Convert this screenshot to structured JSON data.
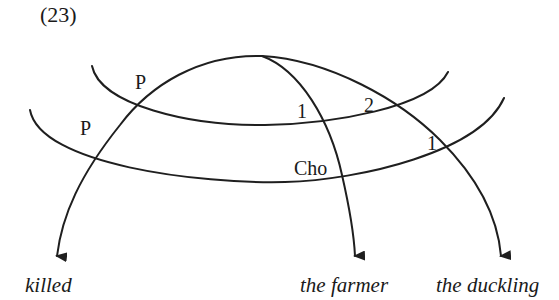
{
  "example": {
    "number": "(23)"
  },
  "diagram": {
    "type": "cluster-arrow diagram",
    "bands": [
      {
        "id": "upper-band",
        "labels": [
          "P",
          "1",
          "2"
        ]
      },
      {
        "id": "lower-band",
        "labels": [
          "P",
          "Cho",
          "1"
        ]
      }
    ],
    "labels": {
      "upper_p": "P",
      "lower_p": "P",
      "upper_1": "1",
      "upper_2": "2",
      "lower_cho": "Cho",
      "lower_1": "1"
    },
    "targets": [
      {
        "id": "killed",
        "text": "killed"
      },
      {
        "id": "the-farmer",
        "text": "the farmer"
      },
      {
        "id": "the-duckling",
        "text": "the duckling"
      }
    ],
    "stroke_color": "#1f1f1f"
  }
}
